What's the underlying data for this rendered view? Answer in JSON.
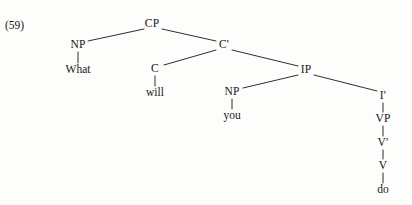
{
  "figure": {
    "example_number": "(59)",
    "background_color": "#fdfdfc",
    "ink_color": "#161616",
    "sentence": "What will you do"
  },
  "tree": {
    "nodes": {
      "cp": {
        "label": "CP",
        "x": 152,
        "y": 24
      },
      "np_spec": {
        "label": "NP",
        "x": 78,
        "y": 45
      },
      "what": {
        "label": "What",
        "x": 78,
        "y": 70
      },
      "cbar": {
        "label": "C'",
        "x": 224,
        "y": 45
      },
      "c": {
        "label": "C",
        "x": 155,
        "y": 69
      },
      "will": {
        "label": "will",
        "x": 155,
        "y": 93
      },
      "ip": {
        "label": "IP",
        "x": 306,
        "y": 70
      },
      "np_subj": {
        "label": "NP",
        "x": 232,
        "y": 92
      },
      "you": {
        "label": "you",
        "x": 232,
        "y": 116
      },
      "ibar": {
        "label": "I'",
        "x": 383,
        "y": 96
      },
      "vp": {
        "label": "VP",
        "x": 383,
        "y": 119
      },
      "vbar": {
        "label": "V'",
        "x": 383,
        "y": 143
      },
      "v": {
        "label": "V",
        "x": 383,
        "y": 166
      },
      "do": {
        "label": "do",
        "x": 383,
        "y": 190
      }
    },
    "branches": [
      {
        "name": "cp-to-np-spec",
        "x1": 144,
        "y1": 29,
        "x2": 88,
        "y2": 41
      },
      {
        "name": "cp-to-cbar",
        "x1": 162,
        "y1": 29,
        "x2": 216,
        "y2": 41
      },
      {
        "name": "cbar-to-c",
        "x1": 216,
        "y1": 50,
        "x2": 164,
        "y2": 65
      },
      {
        "name": "cbar-to-ip",
        "x1": 232,
        "y1": 50,
        "x2": 298,
        "y2": 66
      },
      {
        "name": "ip-to-np-subj",
        "x1": 298,
        "y1": 75,
        "x2": 243,
        "y2": 88
      },
      {
        "name": "ip-to-ibar",
        "x1": 314,
        "y1": 75,
        "x2": 377,
        "y2": 91
      }
    ],
    "stems": [
      {
        "name": "np-spec-to-what",
        "x": 78,
        "y1": 52,
        "y2": 63
      },
      {
        "name": "c-to-will",
        "x": 155,
        "y1": 76,
        "y2": 86
      },
      {
        "name": "np-subj-to-you",
        "x": 232,
        "y1": 99,
        "y2": 109
      },
      {
        "name": "ibar-to-vp",
        "x": 383,
        "y1": 103,
        "y2": 112
      },
      {
        "name": "vp-to-vbar",
        "x": 383,
        "y1": 126,
        "y2": 136
      },
      {
        "name": "vbar-to-v",
        "x": 383,
        "y1": 150,
        "y2": 159
      },
      {
        "name": "v-to-do",
        "x": 383,
        "y1": 173,
        "y2": 183
      }
    ]
  }
}
